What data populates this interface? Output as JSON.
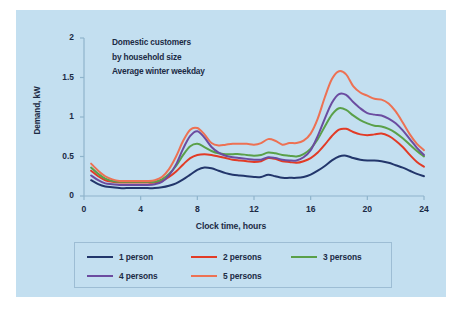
{
  "panel": {
    "background_color": "#c3dff0",
    "page_background_color": "#ffffff"
  },
  "annotation": {
    "line1": "Domestic customers",
    "line2": "by household size",
    "line3": "Average winter weekday"
  },
  "axes": {
    "y_title": "Demand, kW",
    "x_title": "Clock time, hours",
    "y_ticks": [
      "0",
      "0.5",
      "1",
      "1.5",
      "2"
    ],
    "x_ticks": [
      "0",
      "4",
      "8",
      "12",
      "16",
      "20",
      "24"
    ]
  },
  "legend": {
    "entries": [
      {
        "label": "1 person",
        "color": "#22366b"
      },
      {
        "label": "2 persons",
        "color": "#e23b26"
      },
      {
        "label": "3 persons",
        "color": "#5aa049"
      },
      {
        "label": "4 persons",
        "color": "#6b4ca0"
      },
      {
        "label": "5 persons",
        "color": "#ed7153"
      }
    ]
  },
  "chart_data": {
    "type": "line",
    "xlabel": "Clock time, hours",
    "ylabel": "Demand, kW",
    "xlim": [
      0,
      24
    ],
    "ylim": [
      0,
      2
    ],
    "xticks": [
      0,
      4,
      8,
      12,
      16,
      20,
      24
    ],
    "yticks": [
      0,
      0.5,
      1,
      1.5,
      2
    ],
    "grid": false,
    "legend_position": "below-axes",
    "x": [
      0.5,
      1,
      1.5,
      2,
      2.5,
      3,
      3.5,
      4,
      4.5,
      5,
      5.5,
      6,
      6.5,
      7,
      7.5,
      8,
      8.5,
      9,
      9.5,
      10,
      10.5,
      11,
      11.5,
      12,
      12.5,
      13,
      13.5,
      14,
      14.5,
      15,
      15.5,
      16,
      16.5,
      17,
      17.5,
      18,
      18.5,
      19,
      19.5,
      20,
      20.5,
      21,
      21.5,
      22,
      22.5,
      23,
      23.5,
      24
    ],
    "series": [
      {
        "name": "1 person",
        "color": "#22366b",
        "values": [
          0.2,
          0.15,
          0.12,
          0.11,
          0.1,
          0.1,
          0.1,
          0.1,
          0.1,
          0.1,
          0.11,
          0.13,
          0.16,
          0.21,
          0.27,
          0.33,
          0.36,
          0.35,
          0.32,
          0.29,
          0.27,
          0.26,
          0.25,
          0.24,
          0.24,
          0.27,
          0.25,
          0.23,
          0.23,
          0.23,
          0.24,
          0.27,
          0.32,
          0.38,
          0.45,
          0.5,
          0.51,
          0.48,
          0.46,
          0.45,
          0.45,
          0.44,
          0.42,
          0.39,
          0.36,
          0.32,
          0.28,
          0.25
        ]
      },
      {
        "name": "2 persons",
        "color": "#e23b26",
        "values": [
          0.32,
          0.25,
          0.2,
          0.18,
          0.17,
          0.17,
          0.17,
          0.17,
          0.17,
          0.17,
          0.19,
          0.24,
          0.31,
          0.4,
          0.48,
          0.52,
          0.53,
          0.52,
          0.5,
          0.48,
          0.46,
          0.45,
          0.44,
          0.43,
          0.44,
          0.48,
          0.47,
          0.44,
          0.43,
          0.42,
          0.44,
          0.48,
          0.55,
          0.65,
          0.76,
          0.84,
          0.85,
          0.81,
          0.78,
          0.77,
          0.78,
          0.79,
          0.76,
          0.7,
          0.62,
          0.52,
          0.43,
          0.37
        ]
      },
      {
        "name": "3 persons",
        "color": "#5aa049",
        "values": [
          0.36,
          0.28,
          0.22,
          0.19,
          0.18,
          0.18,
          0.18,
          0.18,
          0.18,
          0.18,
          0.21,
          0.28,
          0.38,
          0.52,
          0.63,
          0.66,
          0.62,
          0.57,
          0.54,
          0.53,
          0.53,
          0.53,
          0.52,
          0.51,
          0.52,
          0.55,
          0.54,
          0.52,
          0.51,
          0.5,
          0.53,
          0.6,
          0.72,
          0.88,
          1.03,
          1.11,
          1.09,
          1.02,
          0.96,
          0.92,
          0.89,
          0.88,
          0.85,
          0.8,
          0.73,
          0.65,
          0.57,
          0.5
        ]
      },
      {
        "name": "4 persons",
        "color": "#6b4ca0",
        "values": [
          0.26,
          0.2,
          0.16,
          0.15,
          0.14,
          0.14,
          0.14,
          0.14,
          0.14,
          0.15,
          0.18,
          0.26,
          0.4,
          0.6,
          0.76,
          0.82,
          0.74,
          0.62,
          0.55,
          0.51,
          0.49,
          0.48,
          0.47,
          0.46,
          0.46,
          0.49,
          0.48,
          0.46,
          0.45,
          0.45,
          0.49,
          0.58,
          0.76,
          0.98,
          1.18,
          1.29,
          1.28,
          1.19,
          1.11,
          1.05,
          1.03,
          1.02,
          0.98,
          0.92,
          0.83,
          0.72,
          0.61,
          0.52
        ]
      },
      {
        "name": "5 persons",
        "color": "#ed7153",
        "values": [
          0.41,
          0.32,
          0.25,
          0.21,
          0.19,
          0.19,
          0.19,
          0.19,
          0.19,
          0.2,
          0.24,
          0.34,
          0.5,
          0.7,
          0.84,
          0.86,
          0.78,
          0.67,
          0.64,
          0.65,
          0.66,
          0.66,
          0.66,
          0.65,
          0.67,
          0.72,
          0.7,
          0.65,
          0.67,
          0.67,
          0.7,
          0.79,
          0.98,
          1.25,
          1.48,
          1.58,
          1.54,
          1.39,
          1.31,
          1.27,
          1.23,
          1.22,
          1.17,
          1.07,
          0.93,
          0.78,
          0.66,
          0.58
        ]
      }
    ]
  }
}
